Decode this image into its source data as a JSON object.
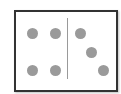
{
  "domino": {
    "left_value": 4,
    "right_value": 3,
    "pip_color": "#9a9a9a",
    "border_color": "#333333",
    "left_pips": [
      [
        16,
        21
      ],
      [
        39,
        21
      ],
      [
        16,
        58
      ],
      [
        39,
        58
      ]
    ],
    "right_pips": [
      [
        64,
        21
      ],
      [
        75,
        40
      ],
      [
        87,
        58
      ]
    ]
  }
}
